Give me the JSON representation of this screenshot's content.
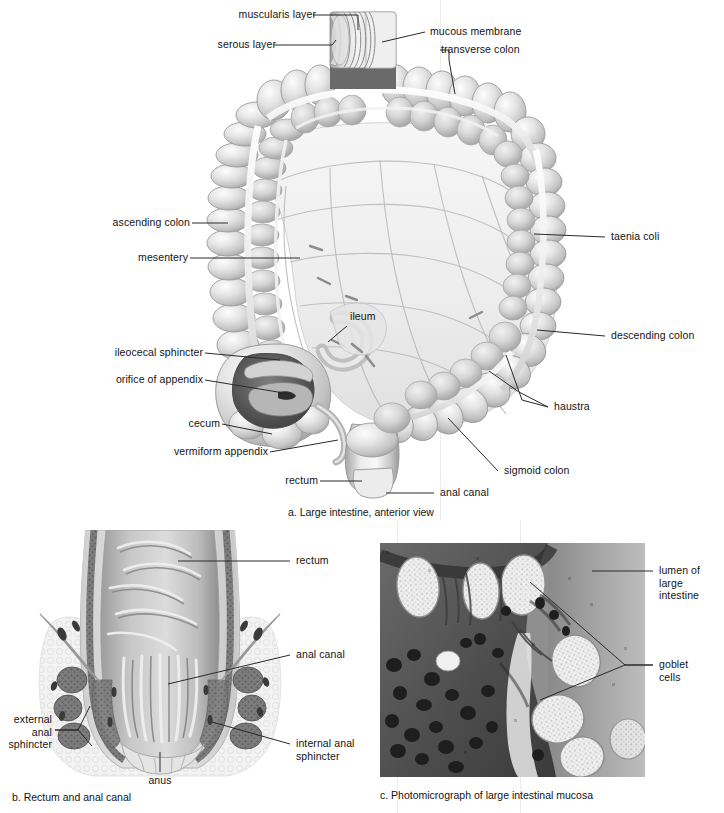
{
  "figure": {
    "panels": [
      {
        "id": "a",
        "caption": "a. Large intestine, anterior view"
      },
      {
        "id": "b",
        "caption": "b. Rectum and anal canal"
      },
      {
        "id": "c",
        "caption": "c. Photomicrograph of large intestinal mucosa"
      }
    ]
  },
  "panel_a": {
    "caption": "a. Large intestine, anterior view",
    "labels": {
      "muscularis_layer": "muscularis layer",
      "serous_layer": "serous layer",
      "mucous_membrane": "mucous membrane",
      "transverse_colon": "transverse colon",
      "ascending_colon": "ascending colon",
      "mesentery": "mesentery",
      "taenia_coli": "taenia coli",
      "ileum": "ileum",
      "descending_colon": "descending colon",
      "ileocecal_sphincter": "ileocecal sphincter",
      "orifice_of_appendix": "orifice of appendix",
      "haustra": "haustra",
      "cecum": "cecum",
      "vermiform_appendix": "vermiform appendix",
      "sigmoid_colon": "sigmoid colon",
      "rectum": "rectum",
      "anal_canal": "anal canal"
    }
  },
  "panel_b": {
    "caption": "b. Rectum and anal canal",
    "labels": {
      "rectum": "rectum",
      "anal_canal": "anal canal",
      "internal_anal_sphincter": "internal anal\nsphincter",
      "external_anal_sphincter": "external\nanal\nsphincter",
      "anus": "anus"
    }
  },
  "panel_c": {
    "caption": "c. Photomicrograph of large intestinal mucosa",
    "labels": {
      "lumen_of_large_intestine": "lumen of\nlarge\nintestine",
      "goblet_cells": "goblet\ncells"
    }
  },
  "colors": {
    "ink": "#131313",
    "leader": "#2a2a2a",
    "tissue_light": "#e9e9e9",
    "tissue_mid": "#c4c4c4",
    "tissue_dark": "#8f8f8f",
    "mesentery": "#eeeeee",
    "micrograph_bg": "#8d8d8d",
    "sphincter_muscle": "#6f6f6f",
    "page_bg": "#ffffff"
  }
}
